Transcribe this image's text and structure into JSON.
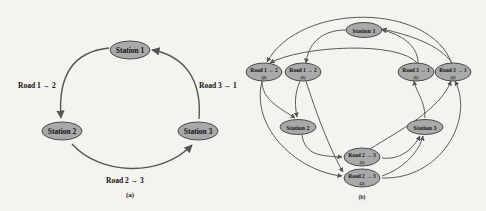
{
  "diagram_a": {
    "caption": "(a)",
    "nodes": [
      {
        "id": "s1",
        "label": "Station 1"
      },
      {
        "id": "s2",
        "label": "Station 2"
      },
      {
        "id": "s3",
        "label": "Station 3"
      }
    ],
    "edges": [
      {
        "from": "s1",
        "to": "s2",
        "label": "Road 1 → 2"
      },
      {
        "from": "s2",
        "to": "s3",
        "label": "Road 2 → 3"
      },
      {
        "from": "s3",
        "to": "s1",
        "label": "Road 3 → 1"
      }
    ]
  },
  "diagram_b": {
    "caption": "(b)",
    "nodes": [
      {
        "id": "s1",
        "label": "Station 1"
      },
      {
        "id": "s2",
        "label": "Station 2"
      },
      {
        "id": "s3",
        "label": "Station 3"
      },
      {
        "id": "r12_2",
        "label": "Road 1 → 2",
        "sub": "(2)"
      },
      {
        "id": "r12_1",
        "label": "Road 1 → 2",
        "sub": "(1)"
      },
      {
        "id": "r31_1",
        "label": "Road 3 → 1",
        "sub": "(1)"
      },
      {
        "id": "r31_2",
        "label": "Road 3 → 1",
        "sub": "(2)"
      },
      {
        "id": "r23_1",
        "label": "Road 2 → 3",
        "sub": "(1)"
      },
      {
        "id": "r23_2",
        "label": "Road 2 → 3",
        "sub": "(2)"
      }
    ]
  },
  "colors": {
    "background": "#f4f3ef",
    "node_fill": "#a9a9a9",
    "node_stroke": "#4a4a4a",
    "edge": "#555555"
  }
}
